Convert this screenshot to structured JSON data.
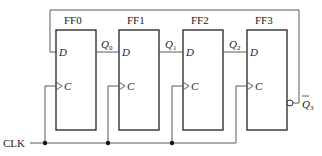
{
  "diagram": {
    "flipflops": [
      {
        "name": "FF0",
        "d_label": "D",
        "c_label": "C",
        "out_label": "Q",
        "out_sub": "0"
      },
      {
        "name": "FF1",
        "d_label": "D",
        "c_label": "C",
        "out_label": "Q",
        "out_sub": "1"
      },
      {
        "name": "FF2",
        "d_label": "D",
        "c_label": "C",
        "out_label": "Q",
        "out_sub": "2"
      },
      {
        "name": "FF3",
        "d_label": "D",
        "c_label": "C",
        "out_label": "Q",
        "out_sub": "3"
      }
    ],
    "clock_label": "CLK",
    "feedback_label": "Q̄3",
    "feedback_main": "Q",
    "feedback_sub": "3",
    "colors": {
      "wire": "#5a5a5a",
      "box": "#222222",
      "background": "#ffffff"
    }
  }
}
